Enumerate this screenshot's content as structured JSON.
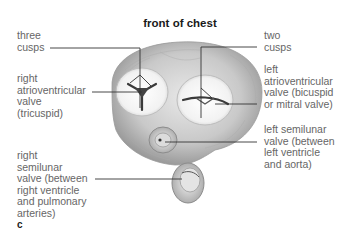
{
  "title": "front of chest",
  "panel_letter": "c",
  "labels": {
    "three_cusps": "three\ncusps",
    "right_av_valve": "right\natrioventricular\nvalve\n(tricuspid)",
    "right_semilunar": "right\nsemilunar\nvalve (between\nright ventricle\nand pulmonary\narteries)",
    "two_cusps": "two\ncusps",
    "left_av_valve": "left\natrioventricular\nvalve (bicuspid\nor mitral valve)",
    "left_semilunar": "left semilunar\nvalve (between\nleft ventricle\nand aorta)"
  },
  "colors": {
    "leader_line": "#333333",
    "label_text": "#666666",
    "heart_fill": "#c8c8c8"
  }
}
